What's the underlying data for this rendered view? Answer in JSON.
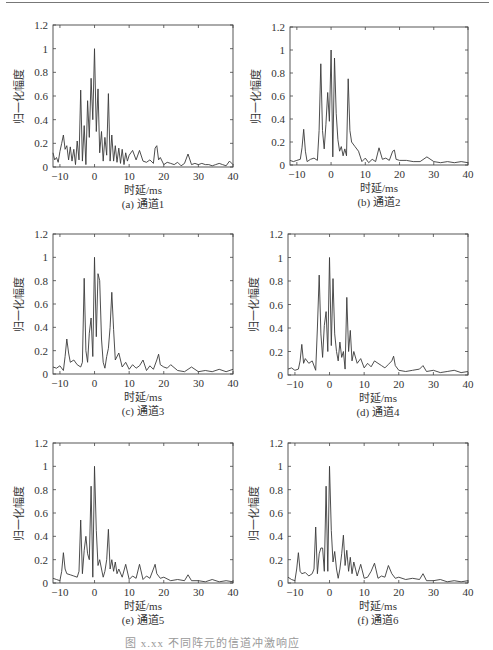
{
  "figure": {
    "bottom_caption": "图 x.xx  不同阵元的信道冲激响应"
  },
  "chart_data": [
    {
      "id": "a",
      "type": "line",
      "caption": "(a) 通道1",
      "xlabel": "时延/ms",
      "ylabel": "归一化幅度",
      "xlim": [
        -12,
        40
      ],
      "ylim": [
        0,
        1.2
      ],
      "xticks": [
        -10,
        0,
        10,
        20,
        30,
        40
      ],
      "yticks": [
        0,
        0.2,
        0.4,
        0.6,
        0.8,
        1,
        1.2
      ],
      "ytick_labels": [
        "0",
        "0.2",
        "0.4",
        "0.6",
        "0.8",
        "1",
        "1.2"
      ],
      "grid": false,
      "x": [
        -12,
        -11.5,
        -11,
        -10.5,
        -10,
        -9.5,
        -9,
        -8.5,
        -8,
        -7.5,
        -7,
        -6.5,
        -6,
        -5.5,
        -5,
        -4.5,
        -4,
        -3.5,
        -3,
        -2.5,
        -2,
        -1.5,
        -1,
        -0.5,
        0,
        0.5,
        1,
        1.5,
        2,
        2.5,
        3,
        3.5,
        4,
        4.5,
        5,
        5.5,
        6,
        6.5,
        7,
        7.5,
        8,
        8.5,
        9,
        9.5,
        10,
        11,
        12,
        13,
        14,
        15,
        16,
        17,
        17.5,
        18,
        18.5,
        19,
        20,
        21,
        22,
        23,
        24,
        25,
        26,
        27,
        28,
        29,
        30,
        31,
        32,
        33,
        34,
        35,
        36,
        37,
        38,
        39,
        40
      ],
      "y": [
        0.12,
        0.06,
        0.08,
        0.04,
        0.13,
        0.2,
        0.27,
        0.15,
        0.18,
        0.06,
        0.17,
        0.05,
        0.15,
        0.02,
        0.22,
        0.06,
        0.65,
        0.05,
        0.35,
        0.02,
        0.56,
        0.25,
        0.75,
        0.4,
        1.0,
        0.3,
        0.66,
        0.12,
        0.3,
        0.05,
        0.25,
        0.1,
        0.62,
        0.05,
        0.27,
        0.05,
        0.18,
        0.04,
        0.16,
        0.03,
        0.15,
        0.02,
        0.12,
        0.05,
        0.1,
        0.14,
        0.06,
        0.14,
        0.05,
        0.04,
        0.06,
        0.03,
        0.16,
        0.18,
        0.06,
        0.08,
        0.02,
        0.04,
        0.03,
        0.02,
        0.04,
        0.01,
        0.03,
        0.11,
        0.02,
        0.03,
        0.02,
        0.03,
        0.02,
        0.02,
        0.01,
        0.02,
        0.03,
        0.02,
        0.01,
        0.05,
        0.02
      ]
    },
    {
      "id": "b",
      "type": "line",
      "caption": "(b) 通道2",
      "xlabel": "时延/ms",
      "ylabel": "归一化幅度",
      "xlim": [
        -12,
        40
      ],
      "ylim": [
        0,
        1.2
      ],
      "xticks": [
        -10,
        0,
        10,
        20,
        30,
        40
      ],
      "yticks": [
        0,
        0.2,
        0.4,
        0.6,
        0.8,
        1,
        1.2
      ],
      "ytick_labels": [
        "0",
        "0.2",
        "0.4",
        "0.6",
        "0.8",
        "1",
        "1.2"
      ],
      "grid": false,
      "x": [
        -12,
        -11,
        -10,
        -9,
        -8.5,
        -8,
        -7.5,
        -7,
        -6,
        -5,
        -4,
        -3.5,
        -3,
        -2.5,
        -2,
        -1.5,
        -1,
        -0.5,
        0,
        0.5,
        1,
        1.5,
        2,
        2.5,
        3,
        3.5,
        4,
        4.5,
        5,
        5.5,
        6,
        7,
        8,
        9,
        10,
        11,
        12,
        13,
        14,
        15,
        16,
        17,
        18,
        18.5,
        19,
        20,
        22,
        24,
        26,
        28,
        30,
        32,
        34,
        36,
        38,
        40
      ],
      "y": [
        0.04,
        0.03,
        0.04,
        0.05,
        0.15,
        0.31,
        0.12,
        0.03,
        0.05,
        0.06,
        0.04,
        0.3,
        0.88,
        0.3,
        0.14,
        0.35,
        0.63,
        0.38,
        1.0,
        0.07,
        0.93,
        0.45,
        0.22,
        0.12,
        0.16,
        0.08,
        0.14,
        0.08,
        0.75,
        0.3,
        0.2,
        0.16,
        0.12,
        0.03,
        0.06,
        0.02,
        0.05,
        0.03,
        0.15,
        0.05,
        0.06,
        0.04,
        0.12,
        0.13,
        0.05,
        0.04,
        0.04,
        0.03,
        0.03,
        0.07,
        0.03,
        0.02,
        0.03,
        0.02,
        0.03,
        0.02
      ]
    },
    {
      "id": "c",
      "type": "line",
      "caption": "(c) 通道3",
      "xlabel": "时延/ms",
      "ylabel": "归一化幅度",
      "xlim": [
        -12,
        40
      ],
      "ylim": [
        0,
        1.2
      ],
      "xticks": [
        -10,
        0,
        10,
        20,
        30,
        40
      ],
      "yticks": [
        0,
        0.2,
        0.4,
        0.6,
        0.8,
        1,
        1.2
      ],
      "ytick_labels": [
        "0",
        "0.2",
        "0.4",
        "0.6",
        "0.8",
        "1",
        "1.2"
      ],
      "grid": false,
      "x": [
        -12,
        -11,
        -10,
        -9,
        -8.5,
        -8,
        -7.5,
        -7,
        -6,
        -5,
        -4,
        -3.5,
        -3,
        -2.5,
        -2,
        -1.5,
        -1,
        -0.5,
        0,
        0.5,
        1,
        1.5,
        2,
        2.5,
        3,
        3.5,
        4,
        4.5,
        5,
        5.5,
        6,
        7,
        8,
        9,
        10,
        11,
        12,
        13,
        14,
        15,
        16,
        17,
        18,
        18.5,
        19,
        20,
        21,
        22,
        24,
        26,
        28,
        30,
        32,
        34,
        36,
        38,
        40
      ],
      "y": [
        0.06,
        0.05,
        0.07,
        0.03,
        0.15,
        0.3,
        0.18,
        0.1,
        0.12,
        0.08,
        0.06,
        0.1,
        0.82,
        0.2,
        0.1,
        0.35,
        0.48,
        0.15,
        1.0,
        0.32,
        0.86,
        0.8,
        0.3,
        0.1,
        0.05,
        0.15,
        0.22,
        0.4,
        0.7,
        0.38,
        0.12,
        0.18,
        0.06,
        0.1,
        0.04,
        0.08,
        0.05,
        0.07,
        0.12,
        0.03,
        0.07,
        0.04,
        0.12,
        0.17,
        0.08,
        0.06,
        0.05,
        0.08,
        0.03,
        0.02,
        0.06,
        0.02,
        0.03,
        0.02,
        0.04,
        0.02,
        0.04
      ]
    },
    {
      "id": "d",
      "type": "line",
      "caption": "(d) 通道4",
      "xlabel": "时延/ms",
      "ylabel": "归一化幅度",
      "xlim": [
        -12,
        40
      ],
      "ylim": [
        0,
        1.2
      ],
      "xticks": [
        -10,
        0,
        10,
        20,
        30,
        40
      ],
      "yticks": [
        0,
        0.2,
        0.4,
        0.6,
        0.8,
        1,
        1.2
      ],
      "ytick_labels": [
        "0",
        "0.2",
        "0.4",
        "0.6",
        "0.8",
        "1",
        "1.2"
      ],
      "grid": false,
      "x": [
        -12,
        -11,
        -10,
        -9,
        -8.5,
        -8,
        -7.5,
        -7,
        -6,
        -5,
        -4,
        -3.5,
        -3,
        -2.5,
        -2,
        -1.5,
        -1,
        -0.5,
        0,
        0.5,
        1,
        1.5,
        2,
        2.5,
        3,
        3.5,
        4,
        4.5,
        5,
        5.5,
        6,
        6.5,
        7,
        8,
        9,
        10,
        11,
        12,
        13,
        14,
        15,
        16,
        17,
        18,
        18.5,
        19,
        20,
        22,
        24,
        26,
        27,
        28,
        30,
        32,
        34,
        36,
        38,
        40
      ],
      "y": [
        0.05,
        0.06,
        0.04,
        0.05,
        0.12,
        0.26,
        0.1,
        0.14,
        0.1,
        0.12,
        0.04,
        0.4,
        0.85,
        0.35,
        0.15,
        0.42,
        0.54,
        0.2,
        1.0,
        0.25,
        0.82,
        0.35,
        0.2,
        0.12,
        0.28,
        0.15,
        0.2,
        0.05,
        0.66,
        0.2,
        0.38,
        0.12,
        0.2,
        0.1,
        0.14,
        0.06,
        0.1,
        0.07,
        0.12,
        0.1,
        0.08,
        0.06,
        0.09,
        0.12,
        0.16,
        0.08,
        0.04,
        0.03,
        0.04,
        0.05,
        0.08,
        0.03,
        0.04,
        0.02,
        0.03,
        0.04,
        0.02,
        0.03
      ]
    },
    {
      "id": "e",
      "type": "line",
      "caption": "(e) 通道5",
      "xlabel": "时延/ms",
      "ylabel": "归一化幅度",
      "xlim": [
        -12,
        40
      ],
      "ylim": [
        0,
        1.2
      ],
      "xticks": [
        -10,
        0,
        10,
        20,
        30,
        40
      ],
      "yticks": [
        0,
        0.2,
        0.4,
        0.6,
        0.8,
        1,
        1.2
      ],
      "ytick_labels": [
        "0",
        "0.2",
        "0.4",
        "0.6",
        "0.8",
        "1",
        "1.2"
      ],
      "grid": false,
      "x": [
        -12,
        -11,
        -10,
        -9.5,
        -9,
        -8.5,
        -8,
        -7,
        -6,
        -5,
        -4.5,
        -4,
        -3.5,
        -3,
        -2.5,
        -2,
        -1.5,
        -1,
        -0.5,
        0,
        0.5,
        1,
        1.5,
        2,
        2.5,
        3,
        3.5,
        4,
        4.5,
        5,
        5.5,
        6,
        6.5,
        7,
        8,
        9,
        10,
        11,
        12,
        13,
        14,
        15,
        16,
        17,
        17.5,
        18,
        19,
        20,
        22,
        24,
        26,
        27,
        28,
        30,
        32,
        34,
        36,
        38,
        40
      ],
      "y": [
        0.04,
        0.03,
        0.02,
        0.1,
        0.26,
        0.12,
        0.08,
        0.07,
        0.06,
        0.05,
        0.1,
        0.54,
        0.08,
        0.28,
        0.4,
        0.25,
        0.2,
        0.83,
        0.05,
        1.0,
        0.45,
        0.15,
        0.2,
        0.12,
        0.05,
        0.1,
        0.2,
        0.46,
        0.12,
        0.2,
        0.1,
        0.18,
        0.08,
        0.12,
        0.05,
        0.16,
        0.03,
        0.06,
        0.04,
        0.16,
        0.03,
        0.06,
        0.04,
        0.12,
        0.16,
        0.08,
        0.04,
        0.05,
        0.02,
        0.03,
        0.02,
        0.07,
        0.02,
        0.02,
        0.01,
        0.03,
        0.01,
        0.02,
        0.01
      ]
    },
    {
      "id": "f",
      "type": "line",
      "caption": "(f) 通道6",
      "xlabel": "时延/ms",
      "ylabel": "归一化幅度",
      "xlim": [
        -12,
        40
      ],
      "ylim": [
        0,
        1.2
      ],
      "xticks": [
        -10,
        0,
        10,
        20,
        30,
        40
      ],
      "yticks": [
        0,
        0.2,
        0.4,
        0.6,
        0.8,
        1,
        1.2
      ],
      "ytick_labels": [
        "0",
        "0.2",
        "0.4",
        "0.6",
        "0.8",
        "1",
        "1.2"
      ],
      "grid": false,
      "x": [
        -12,
        -11,
        -10,
        -9.5,
        -9,
        -8.5,
        -8,
        -7,
        -6,
        -5,
        -4.5,
        -4,
        -3.5,
        -3,
        -2.5,
        -2,
        -1.5,
        -1,
        -0.5,
        0,
        0.5,
        1,
        1.5,
        2,
        2.5,
        3,
        3.5,
        4,
        4.5,
        5,
        5.5,
        6,
        6.5,
        7,
        8,
        9,
        10,
        11,
        12,
        13,
        14,
        15,
        16,
        17,
        18,
        19,
        20,
        22,
        24,
        26,
        27,
        28,
        30,
        32,
        34,
        36,
        38,
        40
      ],
      "y": [
        0.05,
        0.03,
        0.02,
        0.12,
        0.26,
        0.1,
        0.08,
        0.09,
        0.06,
        0.08,
        0.12,
        0.48,
        0.08,
        0.25,
        0.3,
        0.3,
        0.1,
        0.83,
        0.1,
        1.0,
        0.45,
        0.18,
        0.27,
        0.12,
        0.04,
        0.12,
        0.25,
        0.41,
        0.15,
        0.28,
        0.1,
        0.22,
        0.08,
        0.18,
        0.06,
        0.16,
        0.04,
        0.05,
        0.1,
        0.17,
        0.04,
        0.06,
        0.05,
        0.15,
        0.08,
        0.04,
        0.05,
        0.03,
        0.04,
        0.03,
        0.08,
        0.02,
        0.02,
        0.03,
        0.01,
        0.02,
        0.01,
        0.02
      ]
    }
  ]
}
